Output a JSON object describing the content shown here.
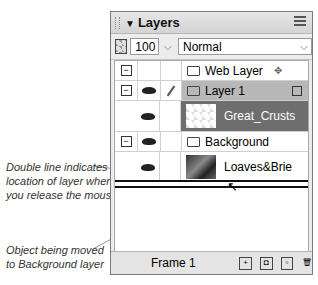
{
  "panel": {
    "title": "Layers",
    "opacity": "100",
    "blend_mode": "Normal",
    "layers": [
      {
        "name": "Web Layer",
        "type": "layer",
        "expanded": true
      },
      {
        "name": "Layer 1",
        "type": "layer",
        "expanded": true,
        "selected": true,
        "objects": [
          {
            "name": "Great_Crusts",
            "selected": true
          }
        ]
      },
      {
        "name": "Background",
        "type": "layer",
        "expanded": true,
        "objects": [
          {
            "name": "Loaves&Brie"
          }
        ]
      }
    ],
    "footer": {
      "frame_label": "Frame 1"
    }
  },
  "annotations": {
    "drop_line": "Double line indicates location of layer when you release the mouse",
    "drop_line_lines": [
      "Double line indicates",
      "location of layer when",
      "you release the mouse"
    ],
    "moving_lines": [
      "Object being moved",
      "to Background layer"
    ]
  }
}
